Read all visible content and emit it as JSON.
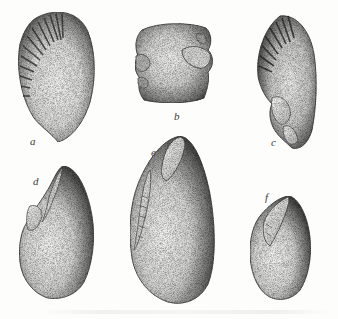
{
  "figure": {
    "type": "stippled scientific illustration plate",
    "background_color": "#fdfdfc",
    "ink_color": "#2a2a2a",
    "specimens": [
      {
        "id": "a",
        "label": "a",
        "description": "ovate shell-like object with radiating ribs at upper left"
      },
      {
        "id": "b",
        "label": "b",
        "description": "squarish block with notched/grooved sides"
      },
      {
        "id": "c",
        "label": "c",
        "description": "ovate object with radiating ribs at upper left, flaked lower edge"
      },
      {
        "id": "d",
        "label": "d",
        "description": "pointed ovoid pebble with flake scar on left upper edge"
      },
      {
        "id": "e",
        "label": "e",
        "description": "large elongated ovoid pebble with flake scar at top and notched left edge"
      },
      {
        "id": "f",
        "label": "f",
        "description": "small ovoid pebble with flake scar on left upper edge"
      }
    ]
  }
}
